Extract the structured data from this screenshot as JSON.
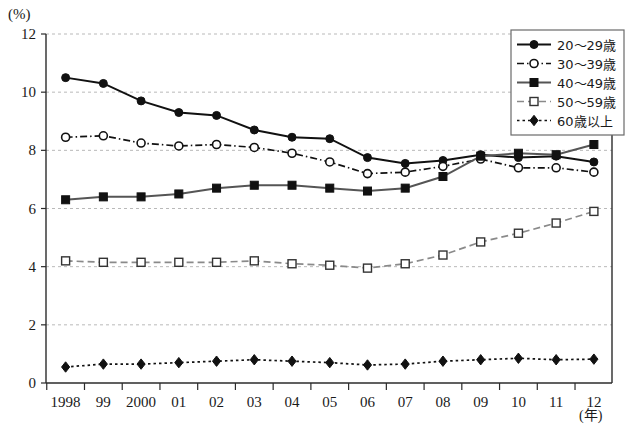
{
  "chart_data": {
    "type": "line",
    "title": "",
    "xlabel": "(年)",
    "ylabel": "(%)",
    "ylim": [
      0,
      12
    ],
    "yticks": [
      0,
      2,
      4,
      6,
      8,
      10,
      12
    ],
    "grid": true,
    "legend_position": "top-right",
    "categories": [
      "1998",
      "99",
      "2000",
      "01",
      "02",
      "03",
      "04",
      "05",
      "06",
      "07",
      "08",
      "09",
      "10",
      "11",
      "12"
    ],
    "x_values": [
      1998,
      1999,
      2000,
      2001,
      2002,
      2003,
      2004,
      2005,
      2006,
      2007,
      2008,
      2009,
      2010,
      2011,
      2012
    ],
    "series": [
      {
        "name": "20〜29歳",
        "marker": "filled-circle",
        "line_style": "solid",
        "color": "#111111",
        "values": [
          10.5,
          10.3,
          9.7,
          9.3,
          9.2,
          8.7,
          8.45,
          8.4,
          7.75,
          7.55,
          7.65,
          7.85,
          7.75,
          7.8,
          7.6
        ]
      },
      {
        "name": "30〜39歳",
        "marker": "open-circle",
        "line_style": "dash-dot",
        "color": "#111111",
        "values": [
          8.45,
          8.5,
          8.25,
          8.15,
          8.2,
          8.1,
          7.9,
          7.6,
          7.2,
          7.25,
          7.45,
          7.7,
          7.4,
          7.4,
          7.25
        ]
      },
      {
        "name": "40〜49歳",
        "marker": "filled-square",
        "line_style": "solid",
        "color": "#555555",
        "values": [
          6.3,
          6.4,
          6.4,
          6.5,
          6.7,
          6.8,
          6.8,
          6.7,
          6.6,
          6.7,
          7.1,
          7.8,
          7.9,
          7.85,
          8.2
        ]
      },
      {
        "name": "50〜59歳",
        "marker": "open-square",
        "line_style": "dashed",
        "color": "#8a8a8a",
        "values": [
          4.2,
          4.15,
          4.15,
          4.15,
          4.15,
          4.2,
          4.1,
          4.05,
          3.95,
          4.1,
          4.4,
          4.85,
          5.15,
          5.5,
          5.9
        ]
      },
      {
        "name": "60歳以上",
        "marker": "filled-diamond",
        "line_style": "dotted",
        "color": "#111111",
        "values": [
          0.55,
          0.65,
          0.65,
          0.7,
          0.75,
          0.8,
          0.75,
          0.7,
          0.62,
          0.65,
          0.75,
          0.8,
          0.85,
          0.8,
          0.82
        ]
      }
    ]
  },
  "legend": {
    "items": [
      {
        "label": "20〜29歳"
      },
      {
        "label": "30〜39歳"
      },
      {
        "label": "40〜49歳"
      },
      {
        "label": "50〜59歳"
      },
      {
        "label": "60歳以上"
      }
    ]
  },
  "axes": {
    "y_unit": "(%)",
    "x_unit": "(年)"
  }
}
